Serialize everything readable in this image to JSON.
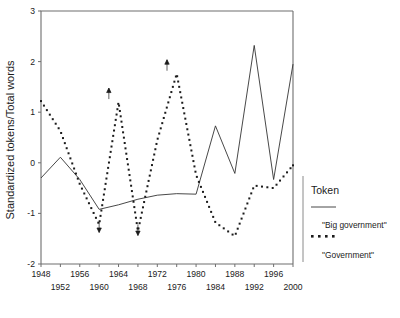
{
  "chart_data": {
    "type": "line",
    "title": "",
    "xlabel": "",
    "ylabel": "Standardized tokens/Total words",
    "xlim": [
      1948,
      2000
    ],
    "ylim": [
      -2,
      3
    ],
    "yticks": [
      3,
      2,
      1,
      0,
      -1,
      -2
    ],
    "yticklabels": [
      "3",
      "2",
      "1",
      "0",
      "-1",
      "-2"
    ],
    "xticks": [
      1948,
      1952,
      1956,
      1960,
      1964,
      1968,
      1972,
      1976,
      1980,
      1984,
      1988,
      1992,
      1996,
      2000
    ],
    "xticklabels_upper": [
      "1948",
      "1956",
      "1964",
      "1972",
      "1980",
      "1988",
      "1996"
    ],
    "xticklabels_lower": [
      "1952",
      "1960",
      "1968",
      "1976",
      "1984",
      "1992",
      "2000"
    ],
    "grid": false,
    "legend_position": "right",
    "legend_title": "Token",
    "series": [
      {
        "name": "\"Big government\"",
        "style": "solid",
        "x": [
          1948,
          1952,
          1956,
          1960,
          1964,
          1968,
          1972,
          1976,
          1980,
          1984,
          1988,
          1992,
          1996,
          2000
        ],
        "values": [
          -0.3,
          0.11,
          -0.33,
          -0.92,
          -0.83,
          -0.72,
          -0.64,
          -0.61,
          -0.62,
          0.73,
          -0.21,
          2.32,
          -0.33,
          1.95
        ]
      },
      {
        "name": "\"Government\"",
        "style": "dotted",
        "x": [
          1948,
          1952,
          1956,
          1960,
          1964,
          1968,
          1972,
          1976,
          1980,
          1984,
          1988,
          1992,
          1996,
          2000
        ],
        "values": [
          1.22,
          0.63,
          -0.42,
          -1.22,
          1.2,
          -1.35,
          0.45,
          1.76,
          -0.24,
          -1.18,
          -1.45,
          -0.45,
          -0.5,
          -0.05
        ]
      }
    ],
    "annotations": [
      {
        "name": "out-of-range-arrow-down-1960",
        "x": 1960,
        "y": -1.12,
        "direction": "down"
      },
      {
        "name": "out-of-range-arrow-up-1962",
        "x": 1962,
        "y": 1.22,
        "direction": "up"
      },
      {
        "name": "out-of-range-arrow-down-1968",
        "x": 1968,
        "y": -1.18,
        "direction": "down"
      },
      {
        "name": "out-of-range-arrow-up-1974",
        "x": 1974,
        "y": 1.78,
        "direction": "up"
      }
    ]
  },
  "legend": {
    "title": "Token",
    "entries": [
      {
        "label": "\"Big government\"",
        "style": "solid"
      },
      {
        "label": "\"Government\"",
        "style": "dotted"
      }
    ]
  },
  "axes": {
    "ylabel": "Standardized tokens/Total words",
    "yticklabels": [
      "3",
      "2",
      "1",
      "0",
      "-1",
      "-2"
    ],
    "xticklabels_upper": [
      "1948",
      "1956",
      "1964",
      "1972",
      "1980",
      "1988",
      "1996"
    ],
    "xticklabels_lower": [
      "1952",
      "1960",
      "1968",
      "1976",
      "1984",
      "1992",
      "2000"
    ]
  },
  "colors": {
    "axis": "#6e6e6e",
    "ink": "#1b1b1b",
    "line": "#333333",
    "background": "#ffffff"
  }
}
